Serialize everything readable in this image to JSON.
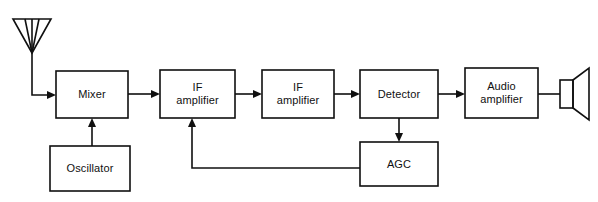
{
  "diagram": {
    "width": 598,
    "height": 202,
    "background_color": "#ffffff",
    "line_color": "#101010",
    "text_color": "#101010",
    "blocks": [
      {
        "id": "mixer",
        "label": "Mixer",
        "x": 56,
        "y": 71,
        "w": 72,
        "h": 47
      },
      {
        "id": "oscillator",
        "label": "Oscillator",
        "x": 50,
        "y": 146,
        "w": 80,
        "h": 45
      },
      {
        "id": "if-amplifier-1",
        "label": "IF\namplifier",
        "x": 160,
        "y": 70,
        "w": 75,
        "h": 48
      },
      {
        "id": "if-amplifier-2",
        "label": "IF\namplifier",
        "x": 262,
        "y": 70,
        "w": 72,
        "h": 48
      },
      {
        "id": "detector",
        "label": "Detector",
        "x": 360,
        "y": 70,
        "w": 78,
        "h": 48
      },
      {
        "id": "audio-amplifier",
        "label": "Audio\namplifier",
        "x": 465,
        "y": 68,
        "w": 73,
        "h": 50
      },
      {
        "id": "agc",
        "label": "AGC",
        "x": 360,
        "y": 142,
        "w": 78,
        "h": 44
      }
    ],
    "symbols": [
      {
        "id": "antenna",
        "label": "antenna-symbol"
      },
      {
        "id": "loudspeaker",
        "label": "loudspeaker-symbol"
      }
    ],
    "signal_path": [
      "antenna",
      "mixer",
      "if-amplifier-1",
      "if-amplifier-2",
      "detector",
      "audio-amplifier",
      "loudspeaker"
    ],
    "connections": [
      {
        "id": "antenna-to-mixer",
        "from": "antenna",
        "to": "mixer",
        "arrow": true
      },
      {
        "id": "oscillator-to-mixer",
        "from": "oscillator",
        "to": "mixer",
        "arrow": true
      },
      {
        "id": "mixer-to-if1",
        "from": "mixer",
        "to": "if-amplifier-1",
        "arrow": true
      },
      {
        "id": "if1-to-if2",
        "from": "if-amplifier-1",
        "to": "if-amplifier-2",
        "arrow": true
      },
      {
        "id": "if2-to-detector",
        "from": "if-amplifier-2",
        "to": "detector",
        "arrow": true
      },
      {
        "id": "detector-to-audio",
        "from": "detector",
        "to": "audio-amplifier",
        "arrow": true
      },
      {
        "id": "audio-to-speaker",
        "from": "audio-amplifier",
        "to": "loudspeaker",
        "arrow": false
      },
      {
        "id": "detector-to-agc",
        "from": "detector",
        "to": "agc",
        "arrow": true
      },
      {
        "id": "agc-feedback-to-if1",
        "from": "agc",
        "to": "if-amplifier-1",
        "arrow": true
      }
    ]
  }
}
